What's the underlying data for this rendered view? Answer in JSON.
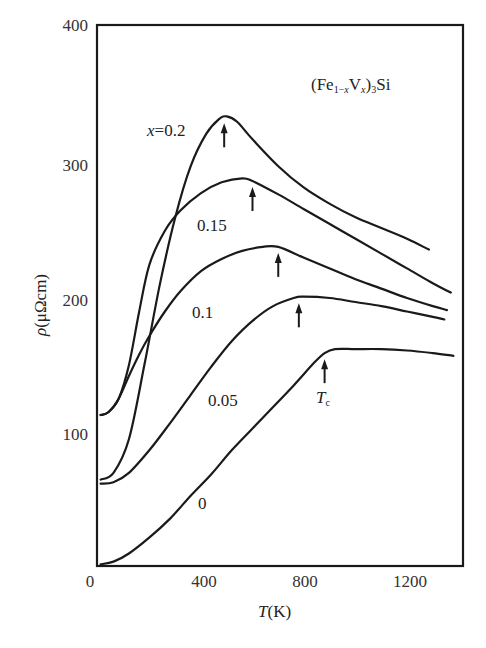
{
  "chart_data": {
    "type": "line",
    "title": "(Fe1−xVx)3Si",
    "xlabel": "T(K)",
    "ylabel": "ρ (μΩcm)",
    "xlim": [
      0,
      1415
    ],
    "ylim": [
      0,
      400
    ],
    "x_ticks": [
      0,
      400,
      800,
      1200
    ],
    "y_ticks": [
      100,
      200,
      300,
      400
    ],
    "grid": false,
    "legend": "inline labels",
    "series": [
      {
        "name": "x=0.2",
        "label": "x=0.2",
        "x": [
          10,
          60,
          120,
          180,
          240,
          300,
          360,
          420,
          470,
          500,
          540,
          600,
          700,
          800,
          900,
          1000,
          1100,
          1200,
          1285
        ],
        "y": [
          65,
          70,
          95,
          150,
          210,
          260,
          298,
          322,
          333,
          335,
          331,
          318,
          298,
          282,
          270,
          260,
          252,
          244,
          236
        ],
        "tc": 490
      },
      {
        "name": "x=0.15",
        "label": "0.15",
        "x": [
          10,
          40,
          80,
          120,
          160,
          200,
          260,
          320,
          400,
          480,
          560,
          600,
          700,
          800,
          900,
          1000,
          1100,
          1200,
          1300,
          1370
        ],
        "y": [
          113,
          115,
          125,
          150,
          190,
          225,
          250,
          265,
          278,
          286,
          289,
          287,
          277,
          266,
          255,
          244,
          233,
          222,
          211,
          204
        ],
        "tc": 600
      },
      {
        "name": "x=0.1",
        "label": "0.1",
        "x": [
          10,
          40,
          80,
          120,
          160,
          200,
          260,
          320,
          400,
          480,
          560,
          640,
          700,
          800,
          900,
          1000,
          1100,
          1200,
          1300,
          1355
        ],
        "y": [
          113,
          115,
          125,
          142,
          158,
          172,
          190,
          205,
          220,
          229,
          235,
          238,
          238,
          230,
          222,
          214,
          207,
          200,
          194,
          191
        ],
        "tc": 700
      },
      {
        "name": "x=0.05",
        "label": "0.05",
        "x": [
          10,
          60,
          120,
          200,
          280,
          360,
          440,
          520,
          600,
          680,
          760,
          800,
          900,
          1000,
          1100,
          1200,
          1300,
          1345
        ],
        "y": [
          62,
          63,
          70,
          87,
          107,
          128,
          149,
          168,
          183,
          194,
          200,
          201,
          200,
          197,
          194,
          190,
          186,
          184
        ],
        "tc": 780
      },
      {
        "name": "x=0",
        "label": "0",
        "x": [
          10,
          60,
          120,
          200,
          280,
          360,
          440,
          520,
          600,
          680,
          760,
          840,
          880,
          920,
          1000,
          1100,
          1200,
          1300,
          1380
        ],
        "y": [
          2,
          4,
          10,
          22,
          36,
          53,
          69,
          87,
          103,
          119,
          135,
          152,
          159,
          162,
          162,
          162,
          161,
          159,
          157
        ],
        "tc": 880
      }
    ],
    "annotations": [
      {
        "text": "Tc",
        "x": 880,
        "y": 125,
        "note": "arrows mark Curie temperature Tc on each curve"
      }
    ]
  },
  "labels": {
    "title_main": "(Fe",
    "title_sub1": "1−",
    "title_subx": "x",
    "title_V": "V",
    "title_subx2": "x",
    "title_close": ")",
    "title_sub3": "3",
    "title_end": "Si",
    "x_axis_T": "T",
    "x_axis_unit": "(K)",
    "y_axis_rho": "ρ",
    "y_axis_unit": "(μΩcm)",
    "curve_x": "x",
    "curve_eq": "=0.2",
    "curve_015": "0.15",
    "curve_01": "0.1",
    "curve_005": "0.05",
    "curve_0": "0",
    "tc_T": "T",
    "tc_sub": "c",
    "xtick0": "0",
    "xtick400": "400",
    "xtick800": "800",
    "xtick1200": "1200",
    "ytick100": "100",
    "ytick200": "200",
    "ytick300": "300",
    "ytick400": "400"
  }
}
